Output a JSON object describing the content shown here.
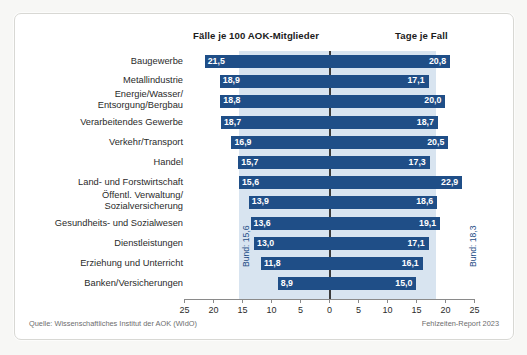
{
  "chart_data": {
    "type": "bar",
    "title": "",
    "subtitle": "",
    "orientation": "horizontal-diverging",
    "xlabel": "",
    "ylabel": "",
    "xlim": [
      -25,
      25
    ],
    "ticks": [
      25,
      20,
      15,
      10,
      5,
      0,
      5,
      10,
      15,
      20,
      25
    ],
    "grid": false,
    "legend_position": "top",
    "left_axis_title": "Fälle je 100 AOK-Mitglieder",
    "right_axis_title": "Tage je Fall",
    "categories": [
      "Baugewerbe",
      "Metallindustrie",
      "Energie/Wasser/\nEntsorgung/Bergbau",
      "Verarbeitendes Gewerbe",
      "Verkehr/Transport",
      "Handel",
      "Land- und Forstwirtschaft",
      "Öffentl. Verwaltung/\nSozialversicherung",
      "Gesundheits- und Sozialwesen",
      "Dienstleistungen",
      "Erziehung und Unterricht",
      "Banken/Versicherungen"
    ],
    "series": [
      {
        "name": "Fälle je 100 AOK-Mitglieder",
        "side": "left",
        "color": "#1f4e87",
        "values": [
          21.5,
          18.9,
          18.8,
          18.7,
          16.9,
          15.7,
          15.6,
          13.9,
          13.6,
          13.0,
          11.8,
          8.9
        ],
        "labels": [
          "21,5",
          "18,9",
          "18,8",
          "18,7",
          "16,9",
          "15,7",
          "15,6",
          "13,9",
          "13,6",
          "13,0",
          "11,8",
          "8,9"
        ]
      },
      {
        "name": "Tage je Fall",
        "side": "right",
        "color": "#1f4e87",
        "values": [
          20.8,
          17.1,
          20.0,
          18.7,
          20.5,
          17.3,
          22.9,
          18.6,
          19.1,
          17.1,
          16.1,
          15.0
        ],
        "labels": [
          "20,8",
          "17,1",
          "20,0",
          "18,7",
          "20,5",
          "17,3",
          "22,9",
          "18,6",
          "19,1",
          "17,1",
          "16,1",
          "15,0"
        ]
      }
    ],
    "reference_bands": [
      {
        "name": "bund-left",
        "label": "Bund: 15,6",
        "value": 15.6,
        "side": "left",
        "color": "#d8e4f0"
      },
      {
        "name": "bund-right",
        "label": "Bund: 18,3",
        "value": 18.3,
        "side": "right",
        "color": "#d8e4f0"
      }
    ],
    "source": "Quelle: Wissenschaftliches Institut der AOK (WIdO)",
    "report": "Fehlzeiten-Report 2023"
  },
  "colors": {
    "bar": "#1f4e87",
    "band": "#d8e4f0",
    "zero_line": "#3b3b3b",
    "axis": "#8a8a8a",
    "text": "#2a2a2a",
    "muted_text": "#6d6d6d",
    "frame_bg": "#ffffff",
    "page_bg": "#f7f7f5"
  }
}
